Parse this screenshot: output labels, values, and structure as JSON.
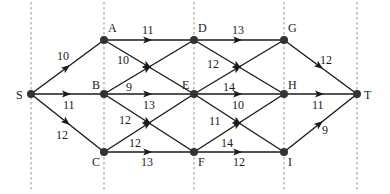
{
  "diagram": {
    "type": "directed-weighted-graph",
    "guides_x": [
      31,
      104,
      194,
      284,
      357
    ],
    "nodes": [
      {
        "id": "S",
        "label": "S",
        "x": 31,
        "y": 94,
        "lx": 16,
        "ly": 99
      },
      {
        "id": "A",
        "label": "A",
        "x": 104,
        "y": 40,
        "lx": 108,
        "ly": 32
      },
      {
        "id": "B",
        "label": "B",
        "x": 104,
        "y": 94,
        "lx": 92,
        "ly": 89
      },
      {
        "id": "C",
        "label": "C",
        "x": 104,
        "y": 152,
        "lx": 92,
        "ly": 166
      },
      {
        "id": "D",
        "label": "D",
        "x": 194,
        "y": 40,
        "lx": 198,
        "ly": 32
      },
      {
        "id": "E",
        "label": "E",
        "x": 194,
        "y": 94,
        "lx": 182,
        "ly": 89
      },
      {
        "id": "F",
        "label": "F",
        "x": 194,
        "y": 152,
        "lx": 198,
        "ly": 166
      },
      {
        "id": "G",
        "label": "G",
        "x": 284,
        "y": 40,
        "lx": 288,
        "ly": 32
      },
      {
        "id": "H",
        "label": "H",
        "x": 284,
        "y": 94,
        "lx": 288,
        "ly": 89
      },
      {
        "id": "I",
        "label": "I",
        "x": 284,
        "y": 152,
        "lx": 288,
        "ly": 166
      },
      {
        "id": "T",
        "label": "T",
        "x": 357,
        "y": 94,
        "lx": 364,
        "ly": 99
      }
    ],
    "edges": [
      {
        "from": "S",
        "to": "A",
        "weight": "10",
        "wx": 57,
        "wy": 60
      },
      {
        "from": "S",
        "to": "B",
        "weight": "11",
        "wx": 63,
        "wy": 109
      },
      {
        "from": "S",
        "to": "C",
        "weight": "12",
        "wx": 56,
        "wy": 139
      },
      {
        "from": "A",
        "to": "D",
        "weight": "11",
        "wx": 142,
        "wy": 34
      },
      {
        "from": "A",
        "to": "E",
        "weight": "10",
        "wx": 117,
        "wy": 64
      },
      {
        "from": "B",
        "to": "D",
        "weight": "9",
        "wx": 126,
        "wy": 91
      },
      {
        "from": "B",
        "to": "E",
        "weight": "13",
        "wx": 143,
        "wy": 109
      },
      {
        "from": "B",
        "to": "F",
        "weight": "12",
        "wx": 119,
        "wy": 124
      },
      {
        "from": "C",
        "to": "E",
        "weight": "12",
        "wx": 129,
        "wy": 147
      },
      {
        "from": "C",
        "to": "F",
        "weight": "13",
        "wx": 141,
        "wy": 166
      },
      {
        "from": "D",
        "to": "G",
        "weight": "13",
        "wx": 232,
        "wy": 34
      },
      {
        "from": "D",
        "to": "H",
        "weight": "12",
        "wx": 207,
        "wy": 68
      },
      {
        "from": "E",
        "to": "G",
        "weight": "14",
        "wx": 223,
        "wy": 91
      },
      {
        "from": "E",
        "to": "H",
        "weight": "10",
        "wx": 232,
        "wy": 109
      },
      {
        "from": "E",
        "to": "I",
        "weight": "11",
        "wx": 209,
        "wy": 125
      },
      {
        "from": "F",
        "to": "H",
        "weight": "14",
        "wx": 221,
        "wy": 147
      },
      {
        "from": "F",
        "to": "I",
        "weight": "12",
        "wx": 233,
        "wy": 166
      },
      {
        "from": "G",
        "to": "T",
        "weight": "12",
        "wx": 320,
        "wy": 64
      },
      {
        "from": "H",
        "to": "T",
        "weight": "11",
        "wx": 312,
        "wy": 109
      },
      {
        "from": "I",
        "to": "T",
        "weight": "9",
        "wx": 322,
        "wy": 134
      }
    ]
  }
}
